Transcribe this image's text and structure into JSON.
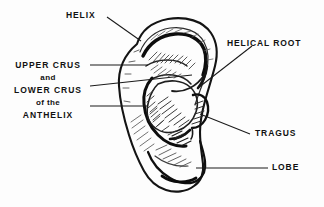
{
  "figure": {
    "background_color": "#fdfdfd",
    "ink_color": "#111111",
    "leader_color": "#1a1a1a"
  },
  "labels": {
    "helix": "HELIX",
    "helical_root": "HELICAL  ROOT",
    "tragus": "TRAGUS",
    "lobe": "LOBE",
    "anthelix_group": {
      "line1": "UPPER  CRUS",
      "line2": "and",
      "line3": "LOWER  CRUS",
      "line4": "of  the",
      "line5": "ANTHELIX"
    }
  }
}
